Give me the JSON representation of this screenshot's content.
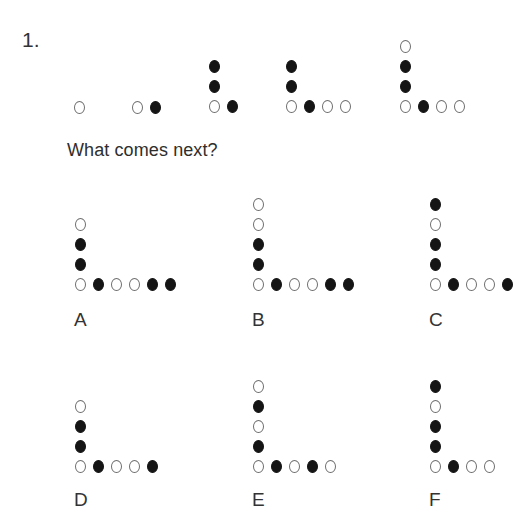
{
  "question": {
    "number": "1.",
    "prompt": "What comes next?"
  },
  "sequence": [
    {
      "anchor": {
        "x": 79,
        "y": 107
      },
      "vertical": [],
      "horizontal": [
        "open"
      ]
    },
    {
      "anchor": {
        "x": 137,
        "y": 107
      },
      "vertical": [],
      "horizontal": [
        "open",
        "filled"
      ]
    },
    {
      "anchor": {
        "x": 214,
        "y": 106
      },
      "vertical": [
        "filled",
        "filled"
      ],
      "horizontal": [
        "open",
        "filled"
      ]
    },
    {
      "anchor": {
        "x": 291,
        "y": 106
      },
      "vertical": [
        "filled",
        "filled"
      ],
      "horizontal": [
        "open",
        "filled",
        "open",
        "open"
      ]
    },
    {
      "anchor": {
        "x": 405,
        "y": 106
      },
      "vertical": [
        "open",
        "filled",
        "filled"
      ],
      "horizontal": [
        "open",
        "filled",
        "open",
        "open"
      ]
    }
  ],
  "options": [
    {
      "label": "A",
      "anchor": {
        "x": 80,
        "y": 284
      },
      "label_pos": {
        "x": 80,
        "y": 320
      },
      "vertical": [
        "open",
        "filled",
        "filled"
      ],
      "horizontal": [
        "open",
        "filled",
        "open",
        "open",
        "filled",
        "filled"
      ]
    },
    {
      "label": "B",
      "anchor": {
        "x": 258,
        "y": 284
      },
      "label_pos": {
        "x": 258,
        "y": 320
      },
      "vertical": [
        "open",
        "open",
        "filled",
        "filled"
      ],
      "horizontal": [
        "open",
        "filled",
        "open",
        "open",
        "filled",
        "filled"
      ]
    },
    {
      "label": "C",
      "anchor": {
        "x": 435,
        "y": 284
      },
      "label_pos": {
        "x": 435,
        "y": 320
      },
      "vertical": [
        "filled",
        "open",
        "filled",
        "filled"
      ],
      "horizontal": [
        "open",
        "filled",
        "open",
        "open",
        "filled"
      ]
    },
    {
      "label": "D",
      "anchor": {
        "x": 80,
        "y": 466
      },
      "label_pos": {
        "x": 80,
        "y": 500
      },
      "vertical": [
        "open",
        "filled",
        "filled"
      ],
      "horizontal": [
        "open",
        "filled",
        "open",
        "open",
        "filled"
      ]
    },
    {
      "label": "E",
      "anchor": {
        "x": 258,
        "y": 466
      },
      "label_pos": {
        "x": 258,
        "y": 500
      },
      "vertical": [
        "open",
        "filled",
        "open",
        "filled"
      ],
      "horizontal": [
        "open",
        "filled",
        "open",
        "filled",
        "open"
      ]
    },
    {
      "label": "F",
      "anchor": {
        "x": 435,
        "y": 466
      },
      "label_pos": {
        "x": 435,
        "y": 500
      },
      "vertical": [
        "filled",
        "open",
        "filled",
        "filled"
      ],
      "horizontal": [
        "open",
        "filled",
        "open",
        "open"
      ]
    }
  ],
  "layout": {
    "dot_spacing_x": 18,
    "dot_spacing_y": 20
  },
  "colors": {
    "filled_dot": "#151515",
    "open_dot_stroke": "#6e6e6e",
    "text": "#2e2e2e",
    "background": "#ffffff"
  }
}
